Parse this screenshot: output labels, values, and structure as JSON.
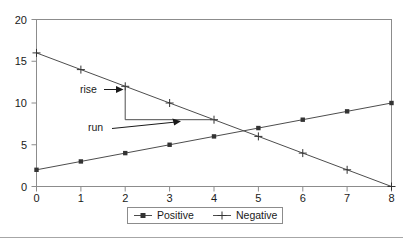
{
  "chart_data": {
    "type": "line",
    "title": "",
    "subtitle": "",
    "xlabel": "",
    "ylabel": "",
    "x": [
      0,
      1,
      2,
      3,
      4,
      5,
      6,
      7,
      8
    ],
    "categories": [
      "0",
      "1",
      "2",
      "3",
      "4",
      "5",
      "6",
      "7",
      "8"
    ],
    "series": [
      {
        "name": "Positive",
        "marker": "filled-square",
        "values": [
          2,
          3,
          4,
          5,
          6,
          7,
          8,
          9,
          10
        ]
      },
      {
        "name": "Negative",
        "marker": "plus",
        "values": [
          16,
          14,
          12,
          10,
          8,
          6,
          4,
          2,
          0
        ]
      }
    ],
    "xlim": [
      0,
      8
    ],
    "ylim": [
      0,
      20
    ],
    "xticks": [
      "0",
      "1",
      "2",
      "3",
      "4",
      "5",
      "6",
      "7",
      "8"
    ],
    "yticks": [
      "0",
      "5",
      "10",
      "15",
      "20"
    ],
    "grid": false,
    "legend_position": "bottom",
    "line_color": "#4d4d4d",
    "axis_color": "#808080",
    "text_color": "#1a1a1a",
    "annotations": [
      {
        "label": "rise",
        "description": "vertical leg of slope triangle from (2,12) to (2,8)",
        "from": [
          2,
          12
        ],
        "to": [
          2,
          8
        ]
      },
      {
        "label": "run",
        "description": "horizontal leg of slope triangle from (2,8) to (4,8)",
        "from": [
          2,
          8
        ],
        "to": [
          4,
          8
        ]
      }
    ]
  },
  "legend": {
    "items": [
      {
        "label": "Positive",
        "marker": "filled-square"
      },
      {
        "label": "Negative",
        "marker": "plus"
      }
    ]
  },
  "axes": {
    "y_tick_0": "0",
    "y_tick_1": "5",
    "y_tick_2": "10",
    "y_tick_3": "15",
    "y_tick_4": "20",
    "x_tick_0": "0",
    "x_tick_1": "1",
    "x_tick_2": "2",
    "x_tick_3": "3",
    "x_tick_4": "4",
    "x_tick_5": "5",
    "x_tick_6": "6",
    "x_tick_7": "7",
    "x_tick_8": "8"
  },
  "annotations": {
    "rise": "rise",
    "run": "run"
  }
}
